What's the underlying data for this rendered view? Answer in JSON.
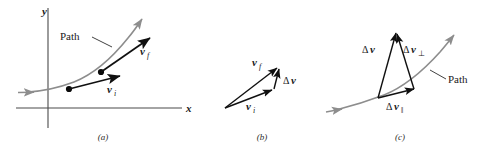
{
  "figure": {
    "background_color": "#ffffff",
    "path_color": "#8d8d8d",
    "vector_color": "#101010",
    "axis_color": "#4a4a4a"
  },
  "panels": [
    {
      "id": "a",
      "caption": "(a)",
      "axes": {
        "y_label": "y",
        "x_label": "x"
      },
      "path_label": "Path",
      "vectors": [
        {
          "name": "v-initial",
          "label_delta": "",
          "label_base": "v",
          "label_sub": "i"
        },
        {
          "name": "v-final",
          "label_delta": "",
          "label_base": "v",
          "label_sub": "f"
        }
      ],
      "point_count": 2
    },
    {
      "id": "b",
      "caption": "(b)",
      "vectors": [
        {
          "name": "v-initial",
          "label_delta": "",
          "label_base": "v",
          "label_sub": "i"
        },
        {
          "name": "v-final",
          "label_delta": "",
          "label_base": "v",
          "label_sub": "f"
        },
        {
          "name": "delta-v",
          "label_delta": "Δ",
          "label_base": "v",
          "label_sub": ""
        }
      ]
    },
    {
      "id": "c",
      "caption": "(c)",
      "path_label": "Path",
      "vectors": [
        {
          "name": "delta-v",
          "label_delta": "Δ",
          "label_base": "v",
          "label_sub": ""
        },
        {
          "name": "delta-v-perp",
          "label_delta": "Δ",
          "label_base": "v",
          "label_sub": "⊥"
        },
        {
          "name": "delta-v-parallel",
          "label_delta": "Δ",
          "label_base": "v",
          "label_sub": "‖"
        }
      ]
    }
  ],
  "labels": {
    "y_axis": "y",
    "x_axis": "x",
    "path_a": "Path",
    "path_c": "Path",
    "delta": "Δ",
    "v": "v",
    "sub_i": "i",
    "sub_f": "f",
    "sub_perp": "⊥",
    "sub_par": "‖",
    "caption_a": "(a)",
    "caption_b": "(b)",
    "caption_c": "(c)"
  }
}
